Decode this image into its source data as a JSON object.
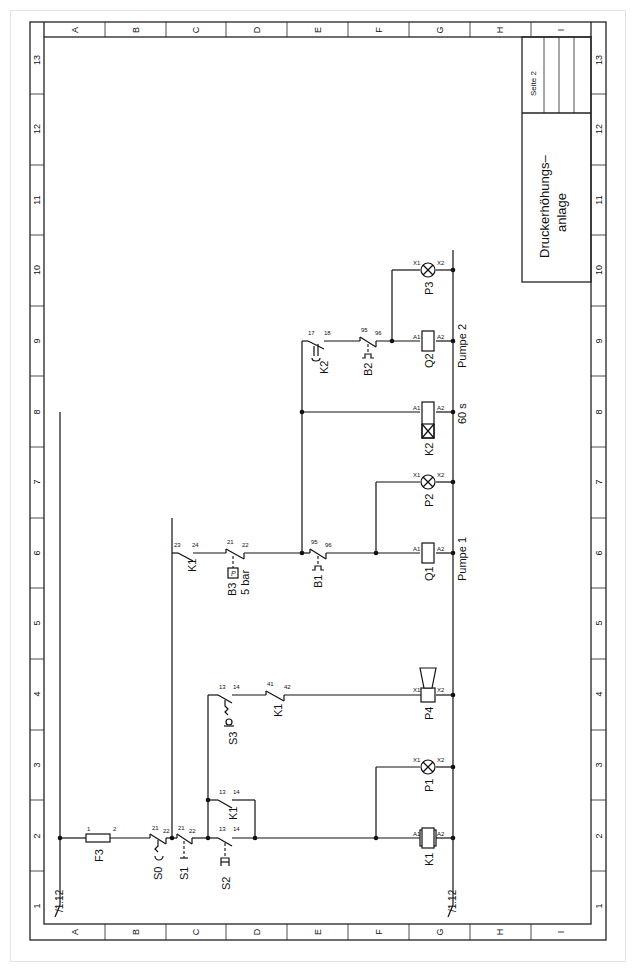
{
  "title_block": {
    "page_label": "Seite 2",
    "title_line1": "Druckerhöhungs–",
    "title_line2": "anlage"
  },
  "frame": {
    "rows": [
      "A",
      "B",
      "C",
      "D",
      "E",
      "F",
      "G",
      "H",
      "I"
    ],
    "columns": [
      "1",
      "2",
      "3",
      "4",
      "5",
      "6",
      "7",
      "8",
      "9",
      "10",
      "11",
      "12",
      "13"
    ]
  },
  "references": {
    "left_rail": "/1.12",
    "right_rail": "/1.12"
  },
  "components": {
    "F3": {
      "label": "F3",
      "pin1": "1",
      "pin2": "2"
    },
    "S0": {
      "label": "S0",
      "pin1": "21",
      "pin2": "22"
    },
    "S1": {
      "label": "S1",
      "pin1": "21",
      "pin2": "22"
    },
    "S2": {
      "label": "S2",
      "pin1": "13",
      "pin2": "14"
    },
    "K1_hold": {
      "label": "K1",
      "pin1": "13",
      "pin2": "14"
    },
    "S3": {
      "label": "S3",
      "pin1": "13",
      "pin2": "14"
    },
    "K1_nc": {
      "label": "K1",
      "pin1": "41",
      "pin2": "42"
    },
    "K1_no": {
      "label": "K1",
      "pin1": "23",
      "pin2": "24"
    },
    "B3": {
      "label": "B3",
      "setting": "5 bar",
      "pin1": "21",
      "pin2": "22",
      "sensor": "P"
    },
    "B1": {
      "label": "B1",
      "pin1": "95",
      "pin2": "96"
    },
    "K2_timer": {
      "label": "K2",
      "pin1": "17",
      "pin2": "18"
    },
    "B2": {
      "label": "B2",
      "pin1": "95",
      "pin2": "96"
    },
    "K1_coil": {
      "label": "K1",
      "a1": "A1",
      "a2": "A2"
    },
    "P1": {
      "label": "P1",
      "x1": "X1",
      "x2": "X2"
    },
    "P4": {
      "label": "P4",
      "x1": "X1",
      "x2": "X2"
    },
    "Q1": {
      "label": "Q1",
      "a1": "A1",
      "a2": "A2",
      "caption": "Pumpe 1"
    },
    "P2": {
      "label": "P2",
      "x1": "X1",
      "x2": "X2"
    },
    "K2_coil": {
      "label": "K2",
      "a1": "A1",
      "a2": "A2",
      "caption": "60 s"
    },
    "Q2": {
      "label": "Q2",
      "a1": "A1",
      "a2": "A2",
      "caption": "Pumpe 2"
    },
    "P3": {
      "label": "P3",
      "x1": "X1",
      "x2": "X2"
    }
  }
}
